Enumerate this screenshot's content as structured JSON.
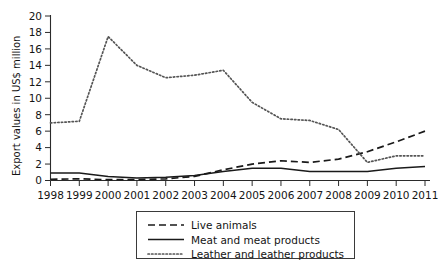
{
  "chart_data": {
    "type": "line",
    "title": "",
    "xlabel": "",
    "ylabel": "Export values in US$ million",
    "x": [
      1998,
      1999,
      2000,
      2001,
      2002,
      2003,
      2004,
      2005,
      2006,
      2007,
      2008,
      2009,
      2010,
      2011
    ],
    "categories": [
      "1998",
      "1999",
      "2000",
      "2001",
      "2002",
      "2003",
      "2004",
      "2005",
      "2006",
      "2007",
      "2008",
      "2009",
      "2010",
      "2011"
    ],
    "ylim": [
      0,
      20
    ],
    "yticks": [
      0,
      2,
      4,
      6,
      8,
      10,
      12,
      14,
      16,
      18,
      20
    ],
    "ytick_labels": [
      "0",
      "2",
      "4",
      "6",
      "8",
      "10",
      "12",
      "14",
      "16",
      "18",
      "20"
    ],
    "grid": false,
    "legend_position": "bottom-center",
    "series": [
      {
        "name": "Live animals",
        "style": "dashed",
        "color": "#1a1a1a",
        "values": [
          0.15,
          0.2,
          0.1,
          0.1,
          0.2,
          0.5,
          1.3,
          2.0,
          2.4,
          2.2,
          2.6,
          3.5,
          4.7,
          6.0
        ]
      },
      {
        "name": "Meat and meat products",
        "style": "solid",
        "color": "#1a1a1a",
        "values": [
          0.9,
          0.9,
          0.5,
          0.3,
          0.4,
          0.6,
          1.1,
          1.5,
          1.5,
          1.1,
          1.1,
          1.1,
          1.5,
          1.7
        ]
      },
      {
        "name": "Leather and leather products",
        "style": "dotted",
        "color": "#555555",
        "values": [
          7.0,
          7.2,
          17.5,
          14.0,
          12.5,
          12.8,
          13.4,
          9.5,
          7.5,
          7.3,
          6.2,
          2.2,
          3.0,
          3.0
        ]
      }
    ]
  },
  "legend": {
    "items": [
      {
        "label": "Live animals",
        "style": "dashed"
      },
      {
        "label": "Meat and meat products",
        "style": "solid"
      },
      {
        "label": "Leather and leather products",
        "style": "dotted"
      }
    ]
  },
  "axes": {
    "y_title": "Export values in US$ million"
  }
}
